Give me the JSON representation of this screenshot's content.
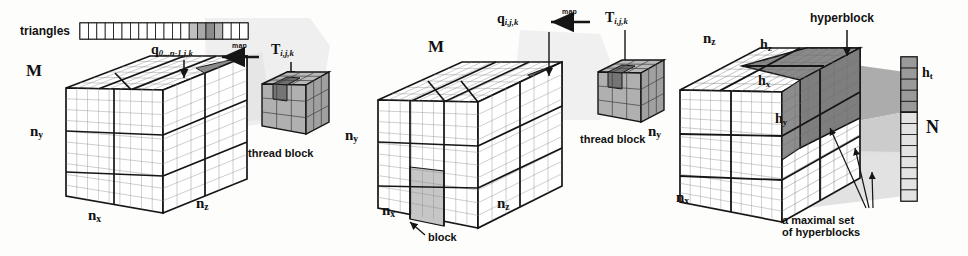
{
  "figure": {
    "background_color": "#fdfdfc",
    "ink_color": "#151515",
    "shade_light": "#d9d9d9",
    "shade_mid": "#b4b4b4",
    "shade_dark": "#8e8e8e",
    "shade_darker": "#707070"
  },
  "panel_left": {
    "name": "left-panel",
    "strip_label": "triangles",
    "strip": {
      "cells": 20,
      "shaded_indices": [
        13,
        14,
        15,
        16
      ],
      "shades": [
        "#bfbfbf",
        "#a8a8a8",
        "#8c8c8c",
        "#b2b2b2"
      ]
    },
    "map_tag": "map",
    "q_label": {
      "base": "q",
      "sub": "0...n-1,j,k"
    },
    "t_label": {
      "base": "T",
      "sub": "i,j,k"
    },
    "axis_m": "M",
    "axis_ny": "n",
    "axis_ny_sub": "y",
    "axis_nx": "n",
    "axis_nx_sub": "x",
    "axis_nz": "n",
    "axis_nz_sub": "z",
    "thread_block_label": "thread block"
  },
  "panel_middle": {
    "name": "middle-panel",
    "map_tag": "map",
    "q_label": {
      "base": "q",
      "sub": "i,j,k"
    },
    "t_label": {
      "base": "T",
      "sub": "i,j,k"
    },
    "axis_m": "M",
    "axis_ny": "n",
    "axis_ny_sub": "y",
    "axis_nx": "n",
    "axis_nx_sub": "x",
    "axis_nz": "n",
    "axis_nz_sub": "z",
    "block_label": "block",
    "thread_block_label": "thread block"
  },
  "panel_right": {
    "name": "right-panel",
    "hyperblock_label": "hyperblock",
    "axis_nz": "n",
    "axis_nz_sub": "z",
    "axis_ny": "n",
    "axis_ny_sub": "y",
    "axis_nx": "n",
    "axis_nx_sub": "x",
    "h_z": {
      "base": "h",
      "sub": "z"
    },
    "h_x": {
      "base": "h",
      "sub": "x"
    },
    "h_y": {
      "base": "h",
      "sub": "y"
    },
    "h_t": {
      "base": "h",
      "sub": "t"
    },
    "n_label": "N",
    "maximal_set_line1": "a maximal set",
    "maximal_set_line2": "of hyperblocks",
    "column": {
      "cells": 13,
      "dark_top_count": 5,
      "dark_color": "#9a9a9a",
      "light_color": "#e3e3e3"
    }
  }
}
